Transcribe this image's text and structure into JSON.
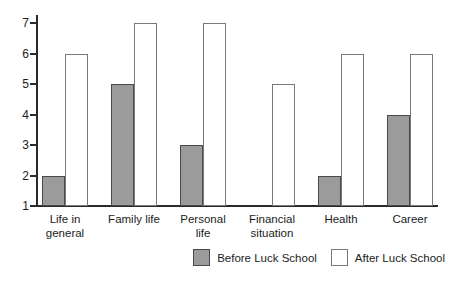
{
  "chart_data": {
    "type": "bar",
    "title": "",
    "xlabel": "",
    "ylabel": "",
    "categories": [
      "Life in\ngeneral",
      "Family life",
      "Personal\nlife",
      "Financial\nsituation",
      "Health",
      "Career"
    ],
    "series": [
      {
        "name": "Before Luck School",
        "values": [
          2,
          5,
          3,
          1,
          2,
          4
        ],
        "fill": "#9b9b9b",
        "border": "#4a4a4a"
      },
      {
        "name": "After Luck School",
        "values": [
          6,
          7,
          7,
          5,
          6,
          6
        ],
        "fill": "#ffffff",
        "border": "#7a7a7a"
      }
    ],
    "ylim": [
      1,
      7
    ],
    "yticks": [
      1,
      2,
      3,
      4,
      5,
      6,
      7
    ],
    "baseline_value": 1,
    "grid": false,
    "legend_position": "bottom-right",
    "axis_color": "#2a2a2a"
  }
}
